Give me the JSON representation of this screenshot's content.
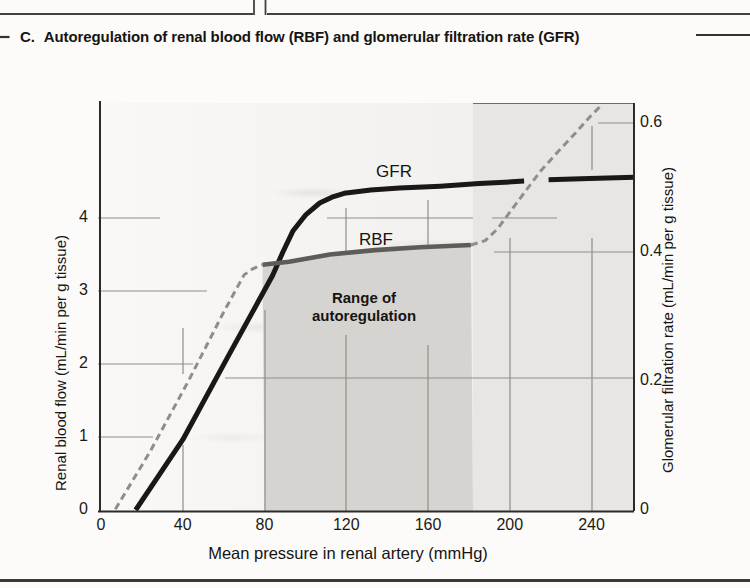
{
  "page": {
    "section_label": "C.",
    "title": "Autoregulation of renal blood flow (RBF) and glomerular filtration rate (GFR)"
  },
  "chart_data": {
    "type": "line",
    "x_axis": {
      "label": "Mean pressure in renal artery (mmHg)",
      "ticks": [
        0,
        40,
        80,
        120,
        160,
        200,
        240
      ],
      "range": [
        0,
        260
      ]
    },
    "y_axis_left": {
      "label": "Renal blood flow (mL/min per g tissue)",
      "ticks": [
        0,
        1,
        2,
        3,
        4
      ],
      "range": [
        0,
        5.6
      ]
    },
    "y_axis_right": {
      "label": "Glomerular filtration rate (mL/min per g tissue)",
      "ticks": [
        0,
        0.2,
        0.4,
        0.6
      ],
      "range": [
        0,
        0.63
      ]
    },
    "band": {
      "label": "Range of autoregulation",
      "x_from": 80,
      "x_to": 182
    },
    "curve_labels": {
      "gfr": "GFR",
      "rbf": "RBF"
    },
    "series": [
      {
        "name": "GFR",
        "axis": "right",
        "style": "solid",
        "color": "#1a1816",
        "width": 5,
        "segments": [
          [
            [
              17,
              0
            ],
            [
              40,
              0.109
            ],
            [
              62,
              0.237
            ],
            [
              84,
              0.364
            ],
            [
              89,
              0.4
            ],
            [
              94,
              0.433
            ],
            [
              100,
              0.457
            ],
            [
              107,
              0.476
            ],
            [
              113,
              0.485
            ],
            [
              119,
              0.491
            ],
            [
              132,
              0.496
            ],
            [
              146,
              0.499
            ],
            [
              166,
              0.502
            ],
            [
              185,
              0.506
            ],
            [
              207,
              0.51
            ]
          ],
          [
            [
              219,
              0.512
            ],
            [
              239,
              0.514
            ],
            [
              261,
              0.516
            ]
          ]
        ]
      },
      {
        "name": "RBF",
        "axis": "left",
        "style": "solid",
        "color": "#5e5c59",
        "width": 4.6,
        "segments": [
          [
            [
              79,
              3.36
            ],
            [
              92,
              3.4
            ],
            [
              112,
              3.5
            ],
            [
              134,
              3.56
            ],
            [
              156,
              3.6
            ],
            [
              181,
              3.63
            ]
          ]
        ]
      },
      {
        "name": "RBF outside autoregulation",
        "axis": "left",
        "style": "dashed",
        "color": "#908e8a",
        "width": 3,
        "segments": [
          [
            [
              7,
              0.01
            ],
            [
              24,
              0.8
            ],
            [
              43,
              1.78
            ],
            [
              60,
              2.71
            ],
            [
              70,
              3.22
            ],
            [
              74,
              3.3
            ],
            [
              77,
              3.34
            ],
            [
              79,
              3.36
            ]
          ],
          [
            [
              181,
              3.63
            ],
            [
              188,
              3.69
            ],
            [
              194,
              3.85
            ],
            [
              200,
              4.08
            ],
            [
              208,
              4.38
            ],
            [
              215,
              4.64
            ],
            [
              224,
              4.92
            ],
            [
              232,
              5.16
            ],
            [
              239,
              5.38
            ],
            [
              245,
              5.55
            ]
          ]
        ]
      }
    ]
  }
}
